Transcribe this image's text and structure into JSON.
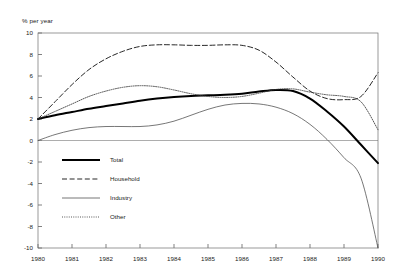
{
  "axis_title": "% per year",
  "legend": {
    "items": [
      {
        "label": "Total",
        "style": "thick-solid"
      },
      {
        "label": "Household",
        "style": "dashed"
      },
      {
        "label": "Industry",
        "style": "thin-solid"
      },
      {
        "label": "Other",
        "style": "dotted"
      }
    ]
  },
  "chart_data": {
    "type": "line",
    "title": "",
    "subtitle": "",
    "xlabel": "",
    "ylabel": "% per year",
    "xlim": [
      1980,
      1990
    ],
    "ylim": [
      -10,
      10
    ],
    "yticks": [
      10,
      8,
      6,
      4,
      2,
      0,
      -2,
      -4,
      -6,
      -8,
      -10
    ],
    "xticks": [
      1980,
      1981,
      1982,
      1983,
      1984,
      1985,
      1986,
      1987,
      1988,
      1989,
      1990
    ],
    "tick_labels_x": [
      "1980",
      "1981",
      "1982",
      "1983",
      "1984",
      "1985",
      "1986",
      "1987",
      "1988",
      "1989",
      "1990"
    ],
    "tick_labels_y": [
      "10",
      "8",
      "6",
      "4",
      "2",
      "0",
      "-2",
      "-4",
      "-6",
      "-8",
      "-10"
    ],
    "grid": false,
    "zero_line": true,
    "legend_position": "lower-left-inside",
    "x": [
      1980,
      1980.5,
      1981,
      1981.5,
      1982,
      1982.5,
      1983,
      1983.5,
      1984,
      1984.5,
      1985,
      1985.5,
      1986,
      1986.5,
      1987,
      1987.5,
      1988,
      1988.5,
      1989,
      1989.5,
      1990
    ],
    "series": [
      {
        "name": "Total",
        "style": "thick-solid",
        "color": "#000000",
        "values": [
          2.0,
          2.35,
          2.65,
          2.95,
          3.2,
          3.45,
          3.7,
          3.9,
          4.05,
          4.15,
          4.2,
          4.25,
          4.35,
          4.55,
          4.7,
          4.6,
          3.9,
          2.7,
          1.3,
          -0.4,
          -2.1
        ]
      },
      {
        "name": "Household",
        "style": "dashed",
        "color": "#000000",
        "values": [
          2.0,
          3.6,
          5.2,
          6.6,
          7.6,
          8.3,
          8.75,
          8.9,
          8.9,
          8.85,
          8.85,
          8.9,
          8.85,
          8.4,
          7.3,
          5.9,
          4.6,
          3.9,
          3.8,
          4.1,
          4.6
        ]
      },
      {
        "name": "Industry",
        "style": "thin-solid",
        "color": "#4a4a4a",
        "values": [
          0.0,
          0.55,
          0.95,
          1.2,
          1.3,
          1.3,
          1.3,
          1.45,
          1.8,
          2.35,
          2.9,
          3.3,
          3.45,
          3.4,
          3.1,
          2.5,
          1.5,
          0.1,
          -1.6,
          -3.5,
          -5.4
        ]
      },
      {
        "name": "Other",
        "style": "dotted",
        "color": "#3a3a3a",
        "values": [
          2.0,
          2.7,
          3.4,
          4.1,
          4.6,
          4.95,
          5.1,
          5.0,
          4.7,
          4.35,
          4.1,
          4.0,
          4.1,
          4.4,
          4.75,
          4.8,
          4.5,
          4.25,
          4.1,
          3.6,
          2.6
        ]
      }
    ],
    "series_late_extension": {
      "note": "Household rises to 6.3 and Industry falls to -10 at 1990",
      "Household_1990": 6.3,
      "Industry_1990": -10.0,
      "Other_1990": 1.0,
      "Total_1990": -2.1
    }
  }
}
